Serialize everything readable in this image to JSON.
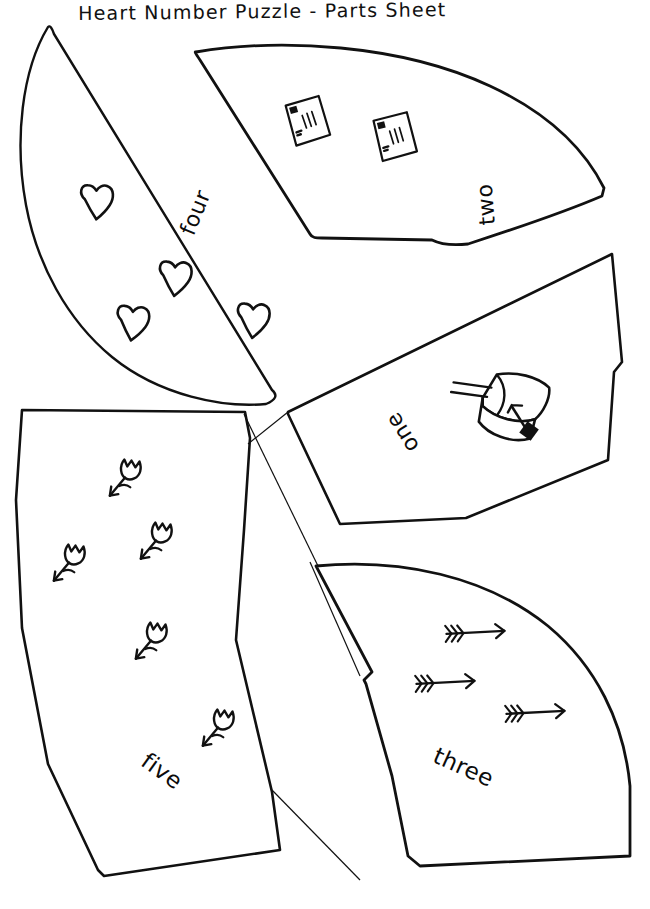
{
  "document": {
    "title": "Heart Number Puzzle - Parts Sheet",
    "corner_mark": "",
    "background_color": "#ffffff",
    "ink_color": "#111111",
    "style": "hand-drawn black ink line art on white paper",
    "page_width": 650,
    "page_height": 909
  },
  "pieces": [
    {
      "id": "piece-four",
      "label": "four",
      "count": 4,
      "motif": "heart",
      "motif_icon": "heart-icon",
      "shape": "half-circle wedge, flat diagonal edge facing lower-right",
      "label_rotation_deg": -68,
      "position": "upper-left"
    },
    {
      "id": "piece-two",
      "label": "two",
      "count": 2,
      "motif": "letter envelope",
      "motif_icon": "envelope-icon",
      "motif_detail": "envelope with postage stamp and squiggly address lines",
      "shape": "curved fan wedge",
      "label_rotation_deg": -95,
      "position": "upper-right"
    },
    {
      "id": "piece-one",
      "label": "one",
      "count": 1,
      "motif": "mailbox",
      "motif_icon": "mailbox-icon",
      "motif_detail": "U.S. MAIL mailbox with raised flag",
      "mailbox_text_line1": "U.S.",
      "mailbox_text_line2": "MAIL",
      "shape": "quadrilateral wedge",
      "label_rotation_deg": -122,
      "position": "middle-right"
    },
    {
      "id": "piece-five",
      "label": "five",
      "count": 5,
      "motif": "tulip flower",
      "motif_icon": "flower-icon",
      "shape": "large elongated wedge",
      "label_rotation_deg": 36,
      "position": "lower-left"
    },
    {
      "id": "piece-three",
      "label": "three",
      "count": 3,
      "motif": "cupid arrow",
      "motif_icon": "arrow-icon",
      "shape": "curved quarter wedge",
      "label_rotation_deg": 24,
      "position": "lower-right"
    }
  ],
  "number_words": [
    "one",
    "two",
    "three",
    "four",
    "five"
  ]
}
